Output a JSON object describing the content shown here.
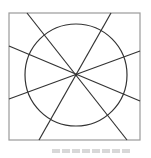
{
  "diagram": {
    "type": "geometry",
    "square": {
      "x": 9,
      "y": 13,
      "width": 131,
      "height": 127,
      "stroke": "#9a9a9a"
    },
    "circle": {
      "cx": 76,
      "cy": 75,
      "r": 51,
      "stroke": "#333333"
    },
    "lines": [
      {
        "x1": 27,
        "y1": 13,
        "x2": 127,
        "y2": 140
      },
      {
        "x1": 111,
        "y1": 13,
        "x2": 39,
        "y2": 140
      },
      {
        "x1": 9,
        "y1": 46,
        "x2": 140,
        "y2": 101
      },
      {
        "x1": 140,
        "y1": 51,
        "x2": 9,
        "y2": 99
      }
    ],
    "line_color": "#333333",
    "center": {
      "x": 76,
      "y": 75
    }
  }
}
